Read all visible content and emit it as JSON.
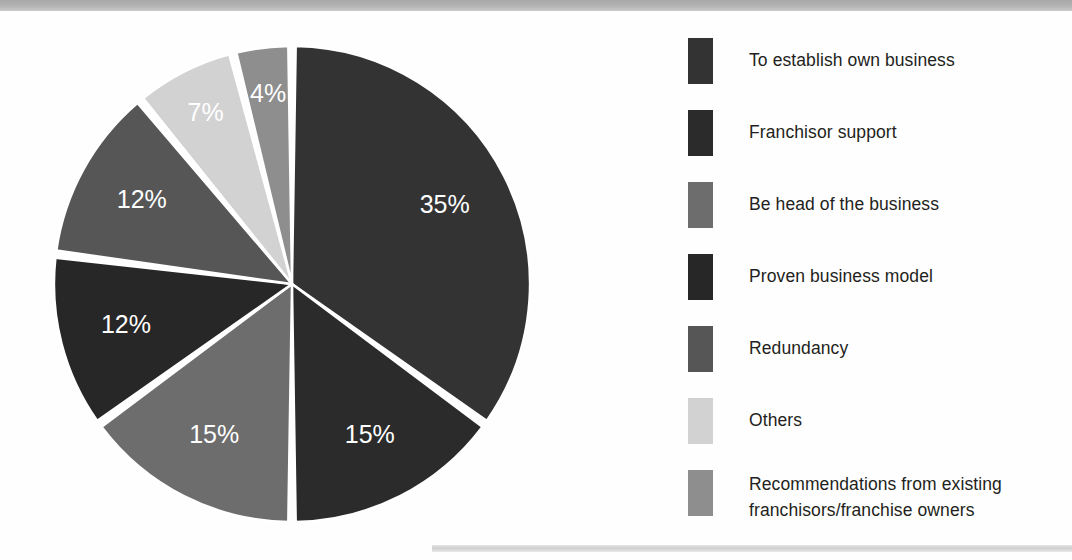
{
  "chart_data": {
    "type": "pie",
    "title": "",
    "subtitle": "",
    "xlabel": "",
    "ylabel": "",
    "legend_position": "right",
    "grid": false,
    "start_angle_deg": 0,
    "direction": "clockwise",
    "total": 100,
    "units": "percent",
    "categories": [
      "To establish own business",
      "Franchisor support",
      "Be head of the business",
      "Proven business model",
      "Redundancy",
      "Others",
      "Recommendations from existing franchisors/franchise owners"
    ],
    "values": [
      35,
      15,
      15,
      12,
      12,
      7,
      4
    ],
    "data_labels": [
      "35%",
      "15%",
      "15%",
      "12%",
      "12%",
      "7%",
      "4%"
    ],
    "colors": [
      "#333333",
      "#2b2b2b",
      "#6d6d6d",
      "#272727",
      "#565656",
      "#d2d2d2",
      "#8e8e8e"
    ],
    "slice_separator_color": "#ffffff",
    "slices": [
      {
        "label": "To establish own business",
        "value": 35,
        "data_label": "35%",
        "color": "#333333",
        "start_deg": 0,
        "end_deg": 126
      },
      {
        "label": "Franchisor support",
        "value": 15,
        "data_label": "15%",
        "color": "#2b2b2b",
        "start_deg": 126,
        "end_deg": 180
      },
      {
        "label": "Be head of the business",
        "value": 15,
        "data_label": "15%",
        "color": "#6d6d6d",
        "start_deg": 180,
        "end_deg": 234
      },
      {
        "label": "Proven business model",
        "value": 12,
        "data_label": "12%",
        "color": "#272727",
        "start_deg": 234,
        "end_deg": 277.2
      },
      {
        "label": "Redundancy",
        "value": 12,
        "data_label": "12%",
        "color": "#565656",
        "start_deg": 277.2,
        "end_deg": 320.4
      },
      {
        "label": "Others",
        "value": 7,
        "data_label": "7%",
        "color": "#d2d2d2",
        "start_deg": 320.4,
        "end_deg": 345.6
      },
      {
        "label": "Recommendations from existing franchisors/franchise owners",
        "value": 4,
        "data_label": "4%",
        "color": "#8e8e8e",
        "start_deg": 345.6,
        "end_deg": 360
      }
    ]
  },
  "legend": {
    "items": [
      {
        "label": "To establish own business",
        "color": "#333333",
        "top": 8,
        "lines": 1
      },
      {
        "label": "Franchisor support",
        "color": "#2b2b2b",
        "top": 80,
        "lines": 1
      },
      {
        "label": "Be head of the business",
        "color": "#6d6d6d",
        "top": 152,
        "lines": 1
      },
      {
        "label": "Proven business model",
        "color": "#272727",
        "top": 224,
        "lines": 1
      },
      {
        "label": "Redundancy",
        "color": "#565656",
        "top": 296,
        "lines": 1
      },
      {
        "label": "Others",
        "color": "#d2d2d2",
        "top": 368,
        "lines": 1
      },
      {
        "label": "Recommendations from existing\nfranchisors/franchise owners",
        "color": "#8e8e8e",
        "top": 440,
        "lines": 2
      }
    ]
  },
  "pie_geometry": {
    "cx": 250,
    "cy": 257,
    "radius": 238,
    "label_radius_ratio": 0.72
  }
}
